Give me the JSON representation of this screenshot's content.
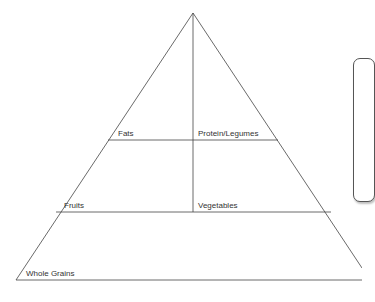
{
  "diagram": {
    "type": "food-pyramid",
    "levels": [
      {
        "left": "Fats",
        "right": "Protein/Legumes"
      },
      {
        "left": "Fruits",
        "right": "Vegetables"
      },
      {
        "left": "Whole Grains"
      }
    ],
    "line_color": "#444444"
  }
}
